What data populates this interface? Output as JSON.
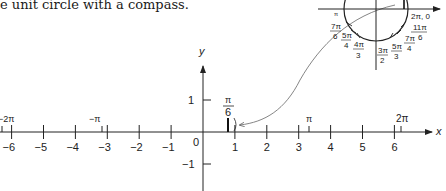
{
  "caption": "e unit circle with a compass.",
  "number_line": {
    "x_axis_label": "x",
    "y_axis_label": "y",
    "x_ticks": [
      {
        "value": -6,
        "label": "−6"
      },
      {
        "value": -5,
        "label": "−5"
      },
      {
        "value": -4,
        "label": "−4"
      },
      {
        "value": -3,
        "label": "−3"
      },
      {
        "value": -2,
        "label": "−2"
      },
      {
        "value": -1,
        "label": "−1"
      },
      {
        "value": 1,
        "label": "1"
      },
      {
        "value": 2,
        "label": "2"
      },
      {
        "value": 3,
        "label": "3"
      },
      {
        "value": 4,
        "label": "4"
      },
      {
        "value": 5,
        "label": "5"
      },
      {
        "value": 6,
        "label": "6"
      }
    ],
    "origin_label": "0",
    "y_ticks": [
      {
        "value": 1,
        "label": "1"
      },
      {
        "value": -1,
        "label": "−1"
      }
    ],
    "pi_marks": [
      {
        "value": -6.283,
        "label": "−2π"
      },
      {
        "value": -3.1416,
        "label": "−π"
      },
      {
        "value": 3.1416,
        "label": "π"
      },
      {
        "value": 6.283,
        "label": "2π"
      }
    ],
    "highlight": {
      "value": 0.5236,
      "num": "π",
      "den": "6"
    }
  },
  "unit_circle": {
    "labels": [
      {
        "id": "pi",
        "text": "π"
      },
      {
        "id": "7pi6",
        "num": "7π",
        "den": "6"
      },
      {
        "id": "5pi4",
        "num": "5π",
        "den": "4"
      },
      {
        "id": "4pi3",
        "num": "4π",
        "den": "3"
      },
      {
        "id": "3pi2",
        "num": "3π",
        "den": "2"
      },
      {
        "id": "5pi3",
        "num": "5π",
        "den": "3"
      },
      {
        "id": "7pi4",
        "num": "7π",
        "den": "4"
      },
      {
        "id": "11pi6",
        "num": "11π",
        "den": "6"
      },
      {
        "id": "2pi0",
        "text": "2π, 0"
      }
    ]
  }
}
